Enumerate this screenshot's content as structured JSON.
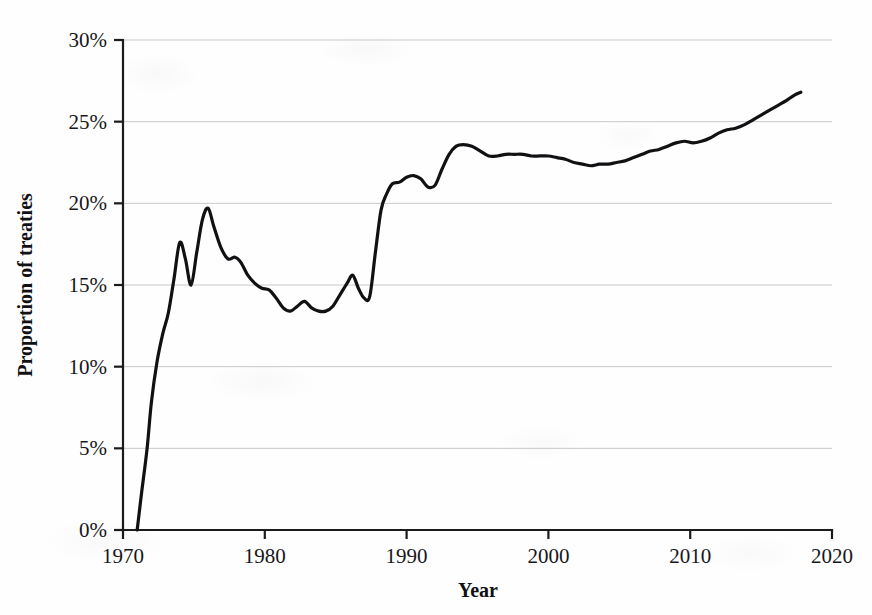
{
  "figure": {
    "background_color": "#fefefe",
    "line_color": "#111114",
    "gridline_color": "#c9c9cc",
    "axis_color": "#1b1b1e"
  },
  "axes": {
    "y_title": "Proportion of treaties",
    "x_title": "Year",
    "y_ticks": [
      "0%",
      "5%",
      "10%",
      "15%",
      "20%",
      "25%",
      "30%"
    ],
    "x_ticks": [
      "1970",
      "1980",
      "1990",
      "2000",
      "2010",
      "2020"
    ]
  },
  "chart_data": {
    "type": "line",
    "title": "",
    "subtitle": "",
    "xlabel": "Year",
    "ylabel": "Proportion of treaties",
    "xlim": [
      1970,
      2020
    ],
    "ylim": [
      0,
      30
    ],
    "y_unit": "percent",
    "grid": true,
    "legend": null,
    "x_tick_values": [
      1970,
      1980,
      1990,
      2000,
      2010,
      2020
    ],
    "y_tick_values": [
      0,
      5,
      10,
      15,
      20,
      25,
      30
    ],
    "y_tick_labels": [
      "0%",
      "5%",
      "10%",
      "15%",
      "20%",
      "25%",
      "30%"
    ],
    "series": [
      {
        "name": "Proportion of treaties",
        "color": "#111114",
        "x": [
          1971.0,
          1971.3,
          1971.7,
          1972.0,
          1972.4,
          1972.8,
          1973.2,
          1973.6,
          1974.0,
          1974.4,
          1974.8,
          1975.2,
          1975.6,
          1976.0,
          1976.4,
          1976.9,
          1977.4,
          1977.9,
          1978.3,
          1978.8,
          1979.3,
          1979.8,
          1980.3,
          1980.8,
          1981.3,
          1981.8,
          1982.3,
          1982.8,
          1983.3,
          1983.8,
          1984.3,
          1984.8,
          1985.3,
          1985.8,
          1986.2,
          1986.6,
          1987.0,
          1987.4,
          1987.8,
          1988.2,
          1988.6,
          1989.0,
          1989.5,
          1990.0,
          1990.5,
          1991.0,
          1991.5,
          1992.0,
          1992.5,
          1993.0,
          1993.5,
          1994.0,
          1994.6,
          1995.2,
          1995.8,
          1996.4,
          1997.0,
          1997.6,
          1998.2,
          1998.8,
          1999.4,
          2000.0,
          2000.6,
          2001.2,
          2001.8,
          2002.4,
          2003.0,
          2003.6,
          2004.2,
          2004.8,
          2005.4,
          2006.0,
          2006.6,
          2007.2,
          2007.8,
          2008.4,
          2009.0,
          2009.6,
          2010.2,
          2010.8,
          2011.4,
          2012.0,
          2012.6,
          2013.2,
          2013.8,
          2014.4,
          2015.0,
          2015.6,
          2016.2,
          2016.8,
          2017.3,
          2017.8
        ],
        "y": [
          0.0,
          2.2,
          5.0,
          7.8,
          10.3,
          12.0,
          13.3,
          15.4,
          17.6,
          16.6,
          15.0,
          17.0,
          19.0,
          19.7,
          18.6,
          17.3,
          16.6,
          16.7,
          16.4,
          15.6,
          15.1,
          14.8,
          14.7,
          14.2,
          13.6,
          13.4,
          13.7,
          14.0,
          13.6,
          13.4,
          13.4,
          13.7,
          14.4,
          15.1,
          15.6,
          14.8,
          14.2,
          14.3,
          17.0,
          19.6,
          20.6,
          21.2,
          21.3,
          21.6,
          21.7,
          21.5,
          21.0,
          21.1,
          22.1,
          23.0,
          23.5,
          23.6,
          23.5,
          23.2,
          22.9,
          22.9,
          23.0,
          23.0,
          23.0,
          22.9,
          22.9,
          22.9,
          22.8,
          22.7,
          22.5,
          22.4,
          22.3,
          22.4,
          22.4,
          22.5,
          22.6,
          22.8,
          23.0,
          23.2,
          23.3,
          23.5,
          23.7,
          23.8,
          23.7,
          23.8,
          24.0,
          24.3,
          24.5,
          24.6,
          24.8,
          25.1,
          25.4,
          25.7,
          26.0,
          26.3,
          26.6,
          26.8
        ]
      }
    ],
    "notable_points": {
      "start": {
        "year": 1971,
        "value": 0.0
      },
      "first_peak": {
        "year": 1974,
        "value": 17.6
      },
      "dip_1975": {
        "year": 1975.2,
        "value": 15.0
      },
      "max_1970s": {
        "year": 1976,
        "value": 19.7
      },
      "trough_1980s": {
        "year": 1982,
        "value": 13.4
      },
      "pre_surge_low": {
        "year": 1987,
        "value": 14.2
      },
      "plateau_1994": {
        "year": 1994,
        "value": 23.6
      },
      "mid_2000s_low": {
        "year": 2003,
        "value": 22.3
      },
      "end": {
        "year": 2017.8,
        "value": 26.8
      }
    }
  }
}
